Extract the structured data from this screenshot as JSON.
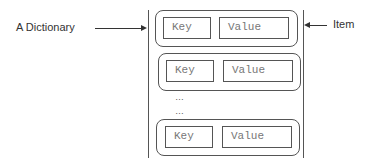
{
  "labels": {
    "dictionary": "A Dictionary",
    "item": "Item"
  },
  "items": [
    {
      "key": "Key",
      "value": "Value"
    },
    {
      "key": "Key",
      "value": "Value"
    },
    {
      "key": "Key",
      "value": "Value"
    }
  ],
  "ellipsis": [
    "…",
    "…"
  ],
  "colors": {
    "stroke": "#555555",
    "text": "#333333",
    "cell_text": "#777777"
  }
}
